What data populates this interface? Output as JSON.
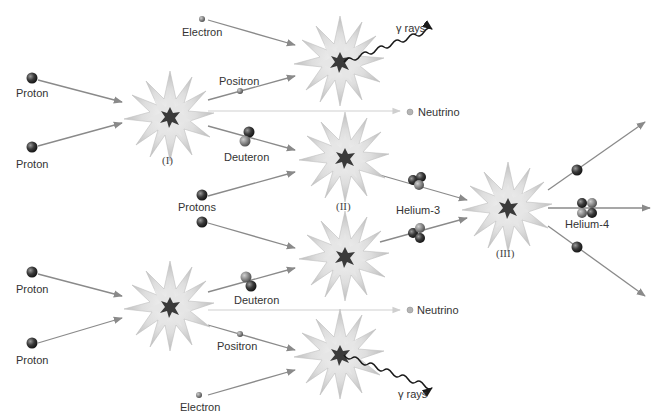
{
  "colors": {
    "arrow": "#8a8a8a",
    "neutrino_line": "#cfcfcf",
    "burst_outer": "#c8c8c8",
    "burst_inner": "#e4e4e4",
    "core": "#3a3a3a",
    "proton": "#2e2e2e",
    "neutron": "#777777",
    "gamma": "#1a1a1a"
  },
  "stages": [
    {
      "id": "I-top",
      "label": "(I)",
      "x": 170,
      "y": 117
    },
    {
      "id": "I-bottom",
      "label": "",
      "x": 170,
      "y": 307
    },
    {
      "id": "II-top",
      "label": "(II)",
      "x": 345,
      "y": 158
    },
    {
      "id": "II-bottom",
      "label": "",
      "x": 345,
      "y": 257
    },
    {
      "id": "gamma-top",
      "label": "",
      "x": 340,
      "y": 62
    },
    {
      "id": "gamma-bottom",
      "label": "",
      "x": 340,
      "y": 355
    },
    {
      "id": "III",
      "label": "(III)",
      "x": 508,
      "y": 208
    }
  ],
  "labels": {
    "proton_tl": "Proton",
    "proton_bl1": "Proton",
    "proton_bl2": "Proton",
    "proton_bl3": "Proton",
    "electron_top": "Electron",
    "electron_bottom": "Electron",
    "positron_top": "Positron",
    "positron_bottom": "Positron",
    "deuteron_top": "Deuteron",
    "deuteron_bottom": "Deuteron",
    "neutrino_top": "Neutrino",
    "neutrino_bottom": "Neutrino",
    "gamma_top": "γ rays",
    "gamma_bottom": "γ rays",
    "protons": "Protons",
    "helium3": "Helium-3",
    "helium4": "Helium-4",
    "stage1": "(I)",
    "stage2": "(II)",
    "stage3": "(III)"
  }
}
